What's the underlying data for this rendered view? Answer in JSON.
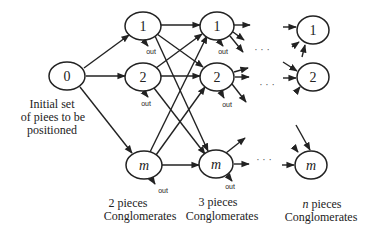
{
  "diagram": {
    "type": "network-flow",
    "nodes": {
      "start": {
        "label": "0"
      },
      "col1": [
        {
          "label": "1"
        },
        {
          "label": "2"
        },
        {
          "label": "m"
        }
      ],
      "col2": [
        {
          "label": "1"
        },
        {
          "label": "2"
        },
        {
          "label": "m"
        }
      ],
      "coln": [
        {
          "label": "1"
        },
        {
          "label": "2"
        },
        {
          "label": "m"
        }
      ]
    },
    "out_label": "out",
    "ellipsis": "· · ·",
    "captions": {
      "start": [
        "Initial set",
        "of piees to be",
        "positioned"
      ],
      "col1": [
        "2 pieces",
        "Conglomerates"
      ],
      "col2": [
        "3 pieces",
        "Conglomerates"
      ],
      "coln_prefix": "n",
      "coln": [
        " pieces",
        "Conglomerates"
      ]
    },
    "colors": {
      "stroke": "#222222",
      "background": "#ffffff"
    }
  }
}
